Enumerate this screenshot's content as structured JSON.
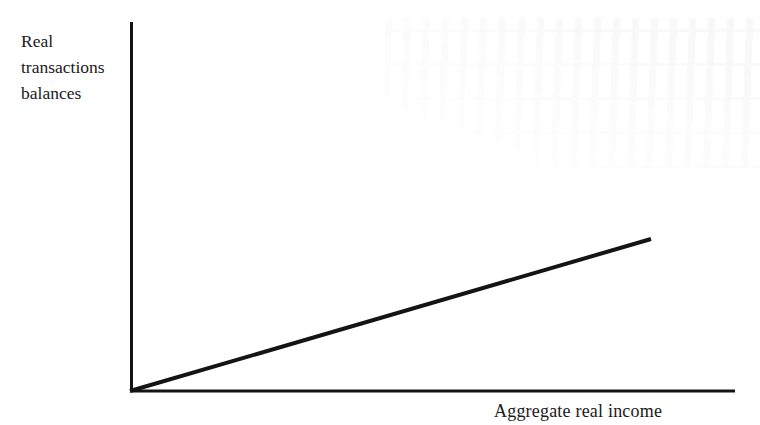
{
  "figure": {
    "background_color": "#ffffff",
    "ink_color": "#141414",
    "y_axis_label": "Real\ntransactions\nbalances",
    "x_axis_label": "Aggregate real income",
    "bleed_through_note": "faint reverse-page scan bleed-through, illegible"
  },
  "chart_data": {
    "type": "line",
    "title": "",
    "subtitle": "",
    "xlabel": "Aggregate real income",
    "ylabel": "Real transactions balances",
    "grid": false,
    "legend": null,
    "axes": {
      "x": {
        "origin_px": 130,
        "end_px": 735,
        "y_px": 391,
        "tick_labels": [],
        "arrow": false
      },
      "y": {
        "origin_px": 391,
        "end_px": 22,
        "x_px": 131,
        "tick_labels": [],
        "arrow": false
      }
    },
    "series": [
      {
        "name": "Transactions demand for money",
        "type": "line",
        "linear": true,
        "through_origin": true,
        "stroke_width_px": 4,
        "color": "#141414",
        "points_px": [
          {
            "x": 130,
            "y": 391
          },
          {
            "x": 651,
            "y": 239
          }
        ],
        "x": [
          0,
          1
        ],
        "values": [
          0,
          1
        ],
        "slope_px_per_px": -0.2917
      }
    ],
    "annotations": []
  }
}
